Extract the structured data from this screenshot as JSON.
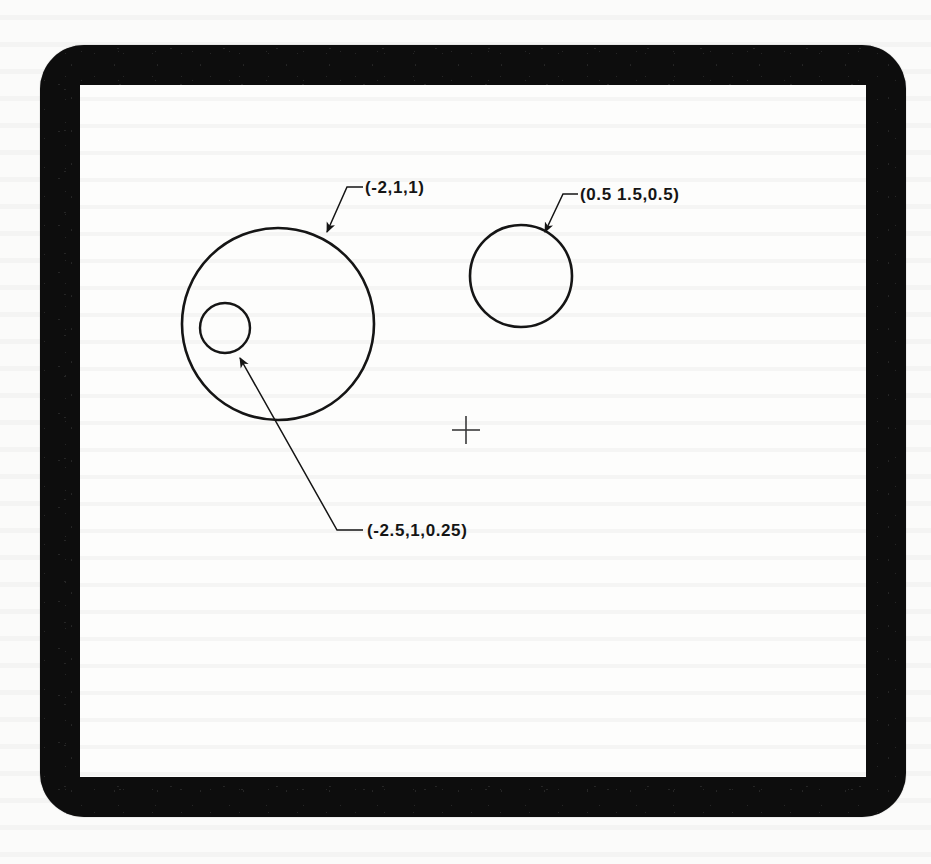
{
  "device": {
    "kind": "crt-graphics-display",
    "bezel_color": "#0d0d0d",
    "screen_color": "#fdfdfc",
    "stroke_color": "#151515"
  },
  "drawing": {
    "title": "",
    "origin_marker": {
      "name": "origin-crosshair",
      "x": 386,
      "y": 345,
      "arm_length": 14
    },
    "circles": [
      {
        "id": "circle-large",
        "label": "(-2,1,1)",
        "cx": 198,
        "cy": 239,
        "r": 96,
        "center_x": -2,
        "center_y": 1,
        "radius_value": 1
      },
      {
        "id": "circle-small-inset",
        "label": "(-2.5,1,0.25)",
        "cx": 145,
        "cy": 243,
        "r": 25,
        "center_x": -2.5,
        "center_y": 1,
        "radius_value": 0.25
      },
      {
        "id": "circle-right",
        "label": "(0.5 1.5,0.5)",
        "cx": 441,
        "cy": 191,
        "r": 51,
        "center_x": 0.5,
        "center_y": 1.5,
        "radius_value": 0.5
      }
    ],
    "leaders": [
      {
        "id": "leader-circle-large",
        "for": "circle-large",
        "arrow_x": 247,
        "arrow_y": 147,
        "elbow_x": 267,
        "elbow_y": 102,
        "end_x": 283,
        "end_y": 102,
        "label_x": 285,
        "label_y": 94
      },
      {
        "id": "leader-circle-right",
        "for": "circle-right",
        "arrow_x": 465,
        "arrow_y": 147,
        "elbow_x": 483,
        "elbow_y": 109,
        "end_x": 498,
        "end_y": 109,
        "label_x": 500,
        "label_y": 101
      },
      {
        "id": "leader-circle-small-inset",
        "for": "circle-small-inset",
        "arrow_x": 160,
        "arrow_y": 273,
        "elbow_x": 257,
        "elbow_y": 445,
        "end_x": 283,
        "end_y": 445,
        "label_x": 287,
        "label_y": 437
      }
    ]
  },
  "labels": {
    "circle_large": "(-2,1,1)",
    "circle_right": "(0.5 1.5,0.5)",
    "circle_small_inset": "(-2.5,1,0.25)"
  }
}
